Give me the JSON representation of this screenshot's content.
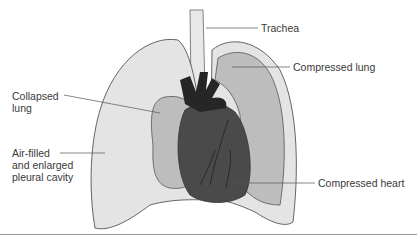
{
  "figure": {
    "labels": {
      "trachea": "Trachea",
      "compressed_lung": "Compressed lung",
      "collapsed_lung": "Collapsed\nlung",
      "pleural_cavity": "Air-filled\nand enlarged\npleural cavity",
      "compressed_heart": "Compressed heart"
    },
    "colors": {
      "pleural_air": "#e4e4e4",
      "lung_tissue": "#b9b9b9",
      "heart": "#4a4a4a",
      "vessels": "#262626",
      "outline": "#555555"
    }
  }
}
